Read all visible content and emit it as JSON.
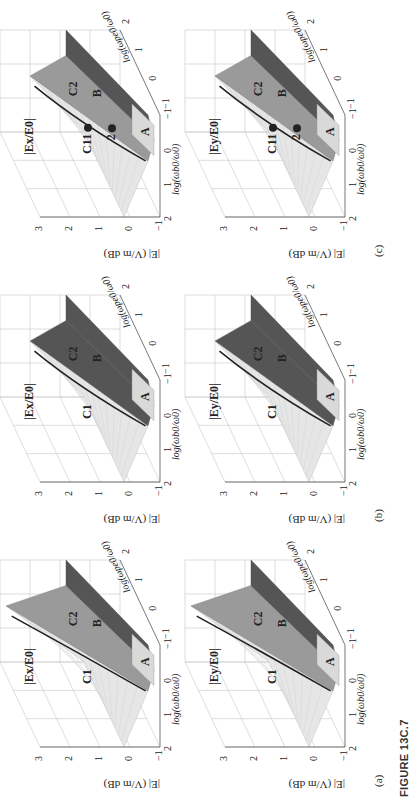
{
  "figure": {
    "label": "FIGURE 13C.7",
    "orientation": "landscape figure rotated 90° counter-clockwise on portrait page"
  },
  "axes": {
    "z_label": "|E| (V/m dB)",
    "z_ticks": [
      "3",
      "2",
      "1",
      "0",
      "−1"
    ],
    "x_label": "log(ωb0/ω0)",
    "x_ticks": [
      "2",
      "1",
      "0",
      "−1"
    ],
    "y_label": "log(ωpe0/ω0)",
    "y_ticks": [
      "−1",
      "0",
      "1",
      "2"
    ]
  },
  "panels": [
    {
      "id": "a-ex",
      "column": "(a)",
      "title": "|Ex/E0|",
      "regions": [
        "C1",
        "C2",
        "A",
        "B"
      ],
      "markers": []
    },
    {
      "id": "a-ey",
      "column": "(a)",
      "title": "|Ey/E0|",
      "regions": [
        "C1",
        "C2",
        "A",
        "B"
      ],
      "markers": []
    },
    {
      "id": "b-ex",
      "column": "(b)",
      "title": "|Ex/E0|",
      "regions": [
        "C1",
        "C2",
        "A",
        "B"
      ],
      "markers": []
    },
    {
      "id": "b-ey",
      "column": "(b)",
      "title": "|Ey/E0|",
      "regions": [
        "C1",
        "C2",
        "A",
        "B"
      ],
      "markers": []
    },
    {
      "id": "c-ex",
      "column": "(c)",
      "title": "|Ex/E0|",
      "regions": [
        "C1",
        "C2",
        "A",
        "B"
      ],
      "markers": [
        "1",
        "2"
      ]
    },
    {
      "id": "c-ey",
      "column": "(c)",
      "title": "|Ey/E0|",
      "regions": [
        "C1",
        "C2",
        "A",
        "B"
      ],
      "markers": [
        "1",
        "2"
      ]
    }
  ],
  "captions": {
    "a": "(a)",
    "b": "(b)",
    "c": "(c)"
  },
  "colors": {
    "grid": "#c8c8c8",
    "axis": "#555555",
    "surface_light": "#e6e6e6",
    "surface_mid": "#9a9a9a",
    "surface_dark": "#555555",
    "curve": "#222222"
  },
  "chart_data": {
    "type": "surface3d",
    "title": "FIGURE 13C.7",
    "panels": [
      "(a) |Ex/E0|",
      "(a) |Ey/E0|",
      "(b) |Ex/E0|",
      "(b) |Ey/E0|",
      "(c) |Ex/E0|",
      "(c) |Ey/E0|"
    ],
    "xlabel": "log(ωb0/ω0)",
    "ylabel": "log(ωpe0/ω0)",
    "zlabel": "|E| (V/m dB)",
    "xlim": [
      -1,
      2
    ],
    "ylim": [
      -1,
      2
    ],
    "zlim": [
      -1,
      3
    ],
    "regions": [
      "A",
      "B",
      "C1",
      "C2"
    ],
    "grid": true
  }
}
